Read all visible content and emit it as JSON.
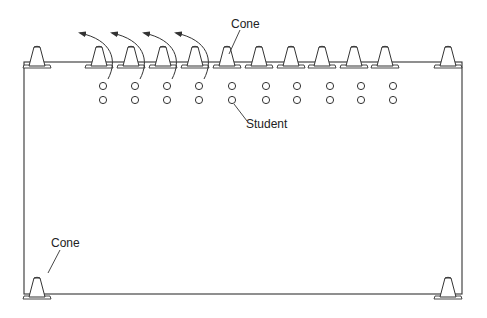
{
  "diagram": {
    "type": "drill-layout",
    "labels": {
      "cone_top": "Cone",
      "student": "Student",
      "cone_bottom": "Cone"
    },
    "field": {
      "x": 24,
      "y": 62,
      "width": 438,
      "height": 232,
      "stroke": "#333333"
    },
    "corner_cones": [
      {
        "x": 37,
        "y": 62
      },
      {
        "x": 448,
        "y": 62
      },
      {
        "x": 37,
        "y": 293
      },
      {
        "x": 448,
        "y": 293
      }
    ],
    "row_cones_x": [
      101,
      132,
      163,
      195,
      227,
      258,
      290,
      322,
      353,
      385
    ],
    "row_cone_base_y": 74,
    "students_x": [
      103,
      135,
      167,
      199,
      231,
      265,
      297,
      329,
      361,
      393
    ],
    "student_rows_y": [
      86,
      100
    ],
    "arrows_count": 4,
    "colors": {
      "line": "#333333",
      "cone_fill": "#ffffff",
      "background": "#ffffff"
    }
  }
}
